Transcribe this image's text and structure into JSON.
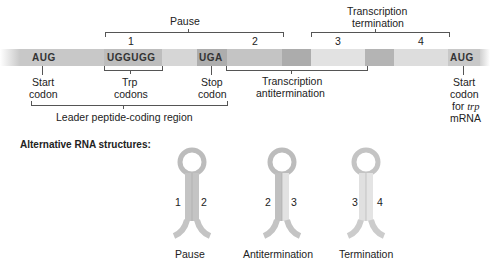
{
  "top_cutoff_text": "",
  "mrna": {
    "codons": [
      {
        "id": "start",
        "text": "AUG"
      },
      {
        "id": "trp",
        "text": "UGGUGG"
      },
      {
        "id": "stop",
        "text": "UGA"
      },
      {
        "id": "start_trp",
        "text": "AUG"
      }
    ],
    "region_numbers": [
      "1",
      "2",
      "3",
      "4"
    ],
    "colors": {
      "leader": "#c8c8c8",
      "codon_box": "#b0b0b0",
      "region1": "#bdbdbd",
      "region2": "#c4c4c4",
      "region2_dark": "#a9a9a9",
      "region3": "#e2e2e2",
      "region3_dark": "#b4b4b4",
      "region4": "#dddddd",
      "gap": "#d8d8d8"
    }
  },
  "brackets": {
    "pause": "Pause",
    "termination_line1": "Transcription",
    "termination_line2": "termination",
    "antitermination_line1": "Transcription",
    "antitermination_line2": "antitermination",
    "leader": "Leader peptide-coding region"
  },
  "labels": {
    "start_codon": [
      "Start",
      "codon"
    ],
    "trp_codons": [
      "Trp",
      "codons"
    ],
    "stop_codon": [
      "Stop",
      "codon"
    ],
    "start_trp": [
      "Start",
      "codon",
      "for ",
      "trp",
      "mRNA"
    ]
  },
  "alt_structures": {
    "heading": "Alternative RNA structures:",
    "items": [
      {
        "name": "Pause",
        "left": "1",
        "right": "2"
      },
      {
        "name": "Antitermination",
        "left": "2",
        "right": "3"
      },
      {
        "name": "Termination",
        "left": "3",
        "right": "4"
      }
    ],
    "colors": {
      "stem_dark": "#bcbcbc",
      "stem_light": "#e0e0e0"
    }
  }
}
